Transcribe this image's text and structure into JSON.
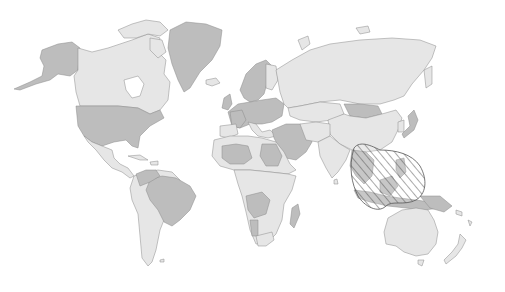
{
  "map": {
    "type": "world-choropleth",
    "style": "grayscale",
    "colors": {
      "background": "#ffffff",
      "light_fill": "#e6e6e6",
      "dark_fill": "#bdbdbd",
      "border": "#8a8a8a",
      "hatch_stroke": "#555555"
    },
    "legend": null,
    "title": null,
    "highlighted_region": {
      "label": "Southeast Asia / Maritime Southeast Asia",
      "pattern": "diagonal-hatch"
    },
    "regions": [
      {
        "name": "North America",
        "shading": "mixed"
      },
      {
        "name": "Greenland",
        "shading": "dark"
      },
      {
        "name": "South America",
        "shading": "mixed"
      },
      {
        "name": "Europe",
        "shading": "mixed"
      },
      {
        "name": "Africa",
        "shading": "mixed"
      },
      {
        "name": "Russia",
        "shading": "light"
      },
      {
        "name": "Asia",
        "shading": "mixed"
      },
      {
        "name": "Australia",
        "shading": "light"
      },
      {
        "name": "New Zealand",
        "shading": "light"
      }
    ]
  }
}
